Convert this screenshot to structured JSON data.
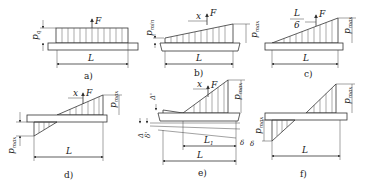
{
  "figure": {
    "panels": [
      {
        "id": "a",
        "caption": "a)",
        "labels": {
          "pressure": "p",
          "pressure_sub": "q",
          "force": "F",
          "length": "L"
        },
        "distribution": "uniform"
      },
      {
        "id": "b",
        "caption": "b)",
        "labels": {
          "pressure_min": "p",
          "pressure_min_sub": "min",
          "pressure_max": "p",
          "pressure_max_sub": "max",
          "offset": "x",
          "force": "F",
          "length": "L"
        },
        "distribution": "trapezoidal"
      },
      {
        "id": "c",
        "caption": "c)",
        "labels": {
          "offset_num": "L",
          "offset_den": "6",
          "force": "F",
          "pressure_max": "p",
          "pressure_max_sub": "max",
          "length": "L"
        },
        "distribution": "triangular"
      },
      {
        "id": "d",
        "caption": "d)",
        "labels": {
          "offset": "x",
          "force": "F",
          "pressure_max_top": "p",
          "pressure_max_top_sub": "max",
          "pressure_max_bottom": "p",
          "pressure_max_bottom_sub": "max",
          "length": "L"
        },
        "distribution": "bi-triangular"
      },
      {
        "id": "e",
        "caption": "e)",
        "labels": {
          "offset": "x",
          "force": "F",
          "pressure_max": "p",
          "pressure_max_sub": "max",
          "delta_prime": "Δ'",
          "delta": "Δ",
          "delta_small": "δ",
          "delta_small_prime": "δ'",
          "delta_end": "δ",
          "length_partial": "L",
          "length_partial_sub": "1",
          "length": "L"
        },
        "distribution": "triangular-with-clearance"
      },
      {
        "id": "f",
        "caption": "f)",
        "labels": {
          "pressure_max_top": "p",
          "pressure_max_top_sub": "max",
          "pressure_max_bottom": "p",
          "pressure_max_bottom_sub": "max",
          "delta": "δ",
          "length": "L"
        },
        "distribution": "bi-triangular"
      }
    ]
  }
}
